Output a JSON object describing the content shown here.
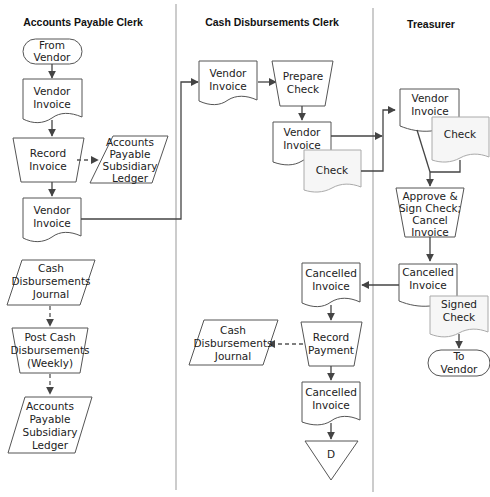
{
  "lanes": [
    {
      "title": "Accounts Payable Clerk"
    },
    {
      "title": "Cash Disbursements Clerk"
    },
    {
      "title": "Treasurer"
    }
  ],
  "nodes": {
    "ap_from_vendor": [
      "From",
      "Vendor"
    ],
    "ap_vendor_invoice_1": [
      "Vendor",
      "Invoice"
    ],
    "ap_record_invoice": [
      "Record",
      "Invoice"
    ],
    "ap_ledger_1": [
      "Accounts",
      "Payable",
      "Subsidiary",
      "Ledger"
    ],
    "ap_vendor_invoice_2": [
      "Vendor",
      "Invoice"
    ],
    "ap_cash_journal": [
      "Cash",
      "Disbursements",
      "Journal"
    ],
    "ap_post_cash": [
      "Post Cash",
      "Disbursements",
      "(Weekly)"
    ],
    "ap_ledger_2": [
      "Accounts",
      "Payable",
      "Subsidiary",
      "Ledger"
    ],
    "cd_vendor_invoice_1": [
      "Vendor",
      "Invoice"
    ],
    "cd_prepare_check": [
      "Prepare",
      "Check"
    ],
    "cd_vendor_invoice_2": [
      "Vendor",
      "Invoice"
    ],
    "cd_check": [
      "Check"
    ],
    "cd_cancelled_invoice_1": [
      "Cancelled",
      "Invoice"
    ],
    "cd_record_payment": [
      "Record",
      "Payment"
    ],
    "cd_cash_journal": [
      "Cash",
      "Disbursements",
      "Journal"
    ],
    "cd_cancelled_invoice_2": [
      "Cancelled",
      "Invoice"
    ],
    "cd_file_d": [
      "D"
    ],
    "tr_vendor_invoice": [
      "Vendor",
      "Invoice"
    ],
    "tr_check": [
      "Check"
    ],
    "tr_approve": [
      "Approve &",
      "Sign Check;",
      "Cancel",
      "Invoice"
    ],
    "tr_cancelled_invoice": [
      "Cancelled",
      "Invoice"
    ],
    "tr_signed_check": [
      "Signed",
      "Check"
    ],
    "tr_to_vendor": [
      "To",
      "Vendor"
    ]
  }
}
